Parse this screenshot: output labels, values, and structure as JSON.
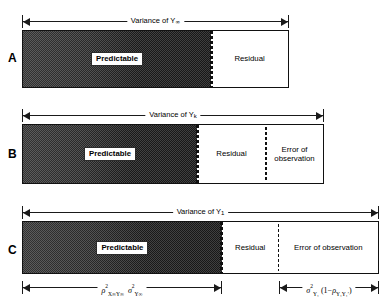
{
  "figure": {
    "type": "variance-decomposition-diagram",
    "panels": [
      {
        "letter": "A",
        "dimension_label_prefix": "Variance of Y",
        "dimension_label_subscript": "∞",
        "segments": [
          {
            "name": "predictable",
            "label": "Predictable",
            "shaded": true,
            "width_pct": 71
          },
          {
            "name": "residual",
            "label": "Residual",
            "shaded": false,
            "width_pct": 29
          }
        ]
      },
      {
        "letter": "B",
        "dimension_label_prefix": "Variance of Y",
        "dimension_label_subscript": "k",
        "segments": [
          {
            "name": "predictable",
            "label": "Predictable",
            "shaded": true,
            "width_pct": 58
          },
          {
            "name": "residual",
            "label": "Residual",
            "shaded": false,
            "width_pct": 23
          },
          {
            "name": "error-observation",
            "label": "Error of\nobservation",
            "shaded": false,
            "width_pct": 19
          }
        ]
      },
      {
        "letter": "C",
        "dimension_label_prefix": "Variance of Y",
        "dimension_label_subscript": "1",
        "segments": [
          {
            "name": "predictable",
            "label": "Predictable",
            "shaded": true,
            "width_pct": 56
          },
          {
            "name": "residual",
            "label": "Residual",
            "shaded": false,
            "width_pct": 16
          },
          {
            "name": "error-observation",
            "label": "Error of observation",
            "shaded": false,
            "width_pct": 28
          }
        ]
      }
    ],
    "formulas": {
      "predictable_variance": {
        "rho": "ρ",
        "rho_exponent": "2",
        "rho_subscript": "X∞Y∞",
        "sigma": "σ",
        "sigma_exponent": "2",
        "sigma_subscript": "Y∞"
      },
      "error_of_observation": {
        "sigma": "σ",
        "sigma_exponent": "2",
        "sigma_subscript": "Y₁",
        "factor_open": "(1−",
        "factor_rho": "ρ",
        "factor_rho_subscript": "Y₁Y₁′",
        "factor_close": ")"
      }
    }
  }
}
